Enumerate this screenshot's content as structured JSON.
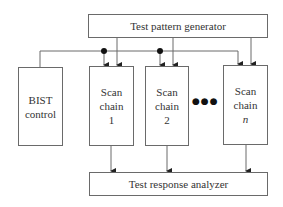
{
  "diagram": {
    "title": "",
    "nodes": {
      "tpg": {
        "label": "Test pattern generator"
      },
      "bist": {
        "line1": "BIST",
        "line2": "control"
      },
      "chain1": {
        "line1": "Scan",
        "line2": "chain",
        "line3": "1"
      },
      "chain2": {
        "line1": "Scan",
        "line2": "chain",
        "line3": "2"
      },
      "chainn": {
        "line1": "Scan",
        "line2": "chain",
        "line3": "n"
      },
      "tra": {
        "label": "Test response analyzer"
      }
    },
    "ellipsis": "●●●",
    "edges": [
      {
        "from": "tpg",
        "to": "chain1"
      },
      {
        "from": "tpg",
        "to": "chain2"
      },
      {
        "from": "tpg",
        "to": "chainn"
      },
      {
        "from": "bist",
        "to": "chain1"
      },
      {
        "from": "bist",
        "to": "chain2"
      },
      {
        "from": "bist",
        "to": "chainn"
      },
      {
        "from": "chain1",
        "to": "tra"
      },
      {
        "from": "chain2",
        "to": "tra"
      },
      {
        "from": "chainn",
        "to": "tra"
      }
    ],
    "colors": {
      "line": "#6a6a6a",
      "text": "#333333",
      "dot": "#111111"
    }
  }
}
